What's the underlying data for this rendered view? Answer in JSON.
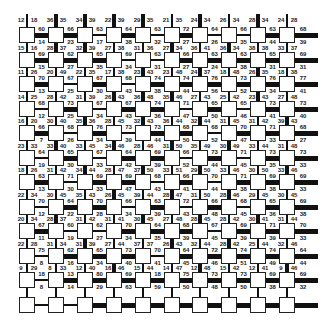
{
  "grid": {
    "cols": 10,
    "rows": 12,
    "col_x": [
      27,
      56,
      85,
      114,
      143,
      172,
      200,
      229,
      258,
      287
    ],
    "row_y": [
      35,
      60,
      84,
      109,
      133,
      158,
      182,
      207,
      231,
      256,
      280,
      305
    ],
    "right_stub": 318,
    "top_stub": 14,
    "colors": {
      "line": "#111111",
      "node_fill": "#ffffff",
      "node_border": "#222222",
      "text": "#222222"
    }
  },
  "top_edge_labels": [
    [
      "12",
      "18"
    ],
    [
      "36",
      "35"
    ],
    [
      "34",
      "39"
    ],
    [
      "22",
      "39"
    ],
    [
      "29",
      "35"
    ],
    [
      "21",
      "35"
    ],
    [
      "24",
      "34"
    ],
    [
      "26",
      "34"
    ],
    [
      "28",
      "34"
    ],
    [
      "24",
      "28"
    ]
  ],
  "row_labels": [
    {
      "horizontal": [
        "60",
        "66",
        "63",
        "64",
        "63",
        "72",
        "64",
        "66",
        "63",
        "68"
      ],
      "left_right": [
        [
          "15",
          "16"
        ],
        [
          "28",
          "37"
        ],
        [
          "32",
          "39"
        ],
        [
          "27",
          "38"
        ],
        [
          "31",
          "36"
        ],
        [
          "27",
          "34"
        ],
        [
          "36",
          "41"
        ],
        [
          "36",
          "34"
        ],
        [
          "38",
          "38"
        ],
        [
          "33",
          "37"
        ]
      ],
      "below": [
        "14",
        "23",
        "17",
        "38",
        "32",
        "27",
        "26",
        "35",
        "44",
        "39"
      ]
    },
    {
      "horizontal": [
        "69",
        "62",
        "65",
        "69",
        "63",
        "66",
        "63",
        "63",
        "65",
        "69"
      ],
      "left_right": [
        [
          "11",
          "26"
        ],
        [
          "20",
          "49"
        ],
        [
          "22",
          "35"
        ],
        [
          "17",
          "38"
        ],
        [
          "23",
          "43"
        ],
        [
          "23",
          "48"
        ],
        [
          "24",
          "37"
        ],
        [
          "18",
          "48"
        ],
        [
          "26",
          "35"
        ],
        [
          "18",
          "38"
        ]
      ],
      "below": [
        "15",
        "27",
        "35",
        "34",
        "31",
        "27",
        "24",
        "38",
        "31",
        "31"
      ]
    },
    {
      "horizontal": [
        "70",
        "67",
        "67",
        "68",
        "74",
        "74",
        "76",
        "73",
        "76",
        "77"
      ],
      "left_right": [
        [
          "14",
          "25"
        ],
        [
          "28",
          "42"
        ],
        [
          "31",
          "39"
        ],
        [
          "26",
          "43"
        ],
        [
          "36",
          "48"
        ],
        [
          "35",
          "46"
        ],
        [
          "27",
          "43"
        ],
        [
          "25",
          "42"
        ],
        [
          "23",
          "43"
        ],
        [
          "27",
          "48"
        ]
      ],
      "below": [
        "13",
        "25",
        "30",
        "43",
        "38",
        "44",
        "56",
        "52",
        "34",
        "41"
      ]
    },
    {
      "horizontal": [
        "68",
        "73",
        "67",
        "67",
        "74",
        "71",
        "65",
        "65",
        "73",
        "73"
      ],
      "left_right": [
        [
          "16",
          "20"
        ],
        [
          "30",
          "40"
        ],
        [
          "35",
          "36"
        ],
        [
          "28",
          "45"
        ],
        [
          "32",
          "43"
        ],
        [
          "36",
          "44"
        ],
        [
          "32",
          "44"
        ],
        [
          "31",
          "45"
        ],
        [
          "31",
          "42"
        ],
        [
          "39",
          "43"
        ]
      ],
      "below": [
        "12",
        "25",
        "34",
        "43",
        "36",
        "47",
        "50",
        "46",
        "41",
        "40"
      ]
    },
    {
      "horizontal": [
        "66",
        "68",
        "76",
        "73",
        "73",
        "68",
        "68",
        "70",
        "71",
        "68"
      ],
      "left_right": [
        [
          "23",
          "33"
        ],
        [
          "33",
          "40"
        ],
        [
          "33",
          "45"
        ],
        [
          "34",
          "46"
        ],
        [
          "28",
          "46"
        ],
        [
          "31",
          "50"
        ],
        [
          "35",
          "49"
        ],
        [
          "30",
          "49"
        ],
        [
          "33",
          "44"
        ],
        [
          "31",
          "48"
        ]
      ],
      "below": [
        "7",
        "26",
        "34",
        "39",
        "44",
        "50",
        "52",
        "47",
        "33",
        "27"
      ]
    },
    {
      "horizontal": [
        "64",
        "65",
        "67",
        "64",
        "69",
        "66",
        "73",
        "71",
        "73",
        "73"
      ],
      "left_right": [
        [
          "18",
          "26"
        ],
        [
          "31",
          "42"
        ],
        [
          "34",
          "44"
        ],
        [
          "28",
          "47"
        ],
        [
          "37",
          "50"
        ],
        [
          "33",
          "51"
        ],
        [
          "29",
          "50"
        ],
        [
          "33",
          "46"
        ],
        [
          "30",
          "50"
        ],
        [
          "33",
          "46"
        ]
      ],
      "below": [
        "19",
        "30",
        "33",
        "42",
        "39",
        "52",
        "44",
        "45",
        "35",
        "33"
      ]
    },
    {
      "horizontal": [
        "63",
        "71",
        "69",
        "69",
        "68",
        "66",
        "70",
        "71",
        "69",
        "69"
      ],
      "left_right": [
        [
          "22",
          "34"
        ],
        [
          "30",
          "45"
        ],
        [
          "35",
          "43"
        ],
        [
          "26",
          "45"
        ],
        [
          "39",
          "44"
        ],
        [
          "28",
          "47"
        ],
        [
          "31",
          "50"
        ],
        [
          "28",
          "46"
        ],
        [
          "29",
          "45"
        ],
        [
          "30",
          "45"
        ]
      ],
      "below": [
        "13",
        "30",
        "33",
        "47",
        "43",
        "41",
        "44",
        "38",
        "38",
        "33"
      ]
    },
    {
      "horizontal": [
        "70",
        "64",
        "70",
        "66",
        "63",
        "72",
        "66",
        "68",
        "65",
        "69"
      ],
      "left_right": [
        [
          "20",
          "34"
        ],
        [
          "28",
          "37"
        ],
        [
          "31",
          "42"
        ],
        [
          "31",
          "41"
        ],
        [
          "30",
          "45"
        ],
        [
          "27",
          "48"
        ],
        [
          "28",
          "45"
        ],
        [
          "28",
          "42"
        ],
        [
          "30",
          "41"
        ],
        [
          "31",
          "44"
        ]
      ],
      "below": [
        "12",
        "22",
        "28",
        "34",
        "39",
        "43",
        "48",
        "45",
        "36",
        "38"
      ]
    },
    {
      "horizontal": [
        "67",
        "60",
        "62",
        "70",
        "64",
        "68",
        "67",
        "69",
        "71",
        "70"
      ],
      "left_right": [
        [
          "22",
          "28"
        ],
        [
          "31",
          "34"
        ],
        [
          "31",
          "39"
        ],
        [
          "27",
          "44"
        ],
        [
          "37",
          "37"
        ],
        [
          "26",
          "43"
        ],
        [
          "32",
          "44"
        ],
        [
          "28",
          "42"
        ],
        [
          "25",
          "44"
        ],
        [
          "32",
          "46"
        ]
      ],
      "below": [
        "11",
        "19",
        "27",
        "34",
        "35",
        "39",
        "45",
        "39",
        "39",
        "33"
      ]
    },
    {
      "horizontal": [
        "75",
        "62",
        "65",
        "73",
        "70",
        "64",
        "72",
        "74",
        "74",
        "64"
      ],
      "left_right": [
        [
          "9",
          "29"
        ],
        [
          "8",
          "33"
        ],
        [
          "12",
          "40"
        ],
        [
          "16",
          "46"
        ],
        [
          "15",
          "44"
        ],
        [
          "14",
          "47"
        ],
        [
          "12",
          "48"
        ],
        [
          "15",
          "42"
        ],
        [
          "12",
          "41"
        ],
        [
          "9",
          "46"
        ]
      ],
      "below": [
        "8",
        "16",
        "34",
        "40",
        "41",
        "45",
        "46",
        "51",
        "49",
        "44"
      ]
    },
    {
      "horizontal": [
        "18",
        "13",
        "80",
        "69",
        "18",
        "75",
        "73",
        "73",
        "69",
        "69"
      ],
      "left_right": [],
      "below": [
        "8",
        "14",
        "29",
        "63",
        "59",
        "50",
        "48",
        "50",
        "38",
        "32"
      ]
    }
  ],
  "thick_h_edges": [
    [
      0,
      1
    ],
    [
      0,
      2
    ],
    [
      0,
      4
    ],
    [
      0,
      6
    ],
    [
      0,
      9
    ],
    [
      1,
      1
    ],
    [
      1,
      2
    ],
    [
      1,
      3
    ],
    [
      1,
      6
    ],
    [
      1,
      7
    ],
    [
      1,
      8
    ],
    [
      1,
      9
    ],
    [
      2,
      1
    ],
    [
      2,
      3
    ],
    [
      2,
      5
    ],
    [
      2,
      6
    ],
    [
      2,
      7
    ],
    [
      2,
      8
    ],
    [
      2,
      9
    ],
    [
      3,
      2
    ],
    [
      3,
      4
    ],
    [
      3,
      5
    ],
    [
      3,
      7
    ],
    [
      3,
      9
    ],
    [
      4,
      1
    ],
    [
      4,
      3
    ],
    [
      4,
      5
    ],
    [
      4,
      6
    ],
    [
      4,
      8
    ],
    [
      4,
      9
    ],
    [
      5,
      2
    ],
    [
      5,
      4
    ],
    [
      5,
      5
    ],
    [
      5,
      7
    ],
    [
      5,
      9
    ],
    [
      6,
      1
    ],
    [
      6,
      3
    ],
    [
      6,
      4
    ],
    [
      6,
      6
    ],
    [
      6,
      8
    ],
    [
      6,
      9
    ],
    [
      7,
      2
    ],
    [
      7,
      3
    ],
    [
      7,
      5
    ],
    [
      7,
      7
    ],
    [
      7,
      9
    ],
    [
      8,
      1
    ],
    [
      8,
      4
    ],
    [
      8,
      5
    ],
    [
      8,
      6
    ],
    [
      8,
      8
    ],
    [
      8,
      9
    ],
    [
      9,
      2
    ],
    [
      9,
      3
    ],
    [
      9,
      4
    ],
    [
      9,
      6
    ],
    [
      9,
      7
    ],
    [
      9,
      8
    ],
    [
      9,
      9
    ],
    [
      10,
      2
    ],
    [
      10,
      3
    ],
    [
      10,
      4
    ],
    [
      10,
      5
    ],
    [
      10,
      6
    ],
    [
      10,
      7
    ],
    [
      10,
      8
    ],
    [
      10,
      9
    ],
    [
      11,
      3
    ],
    [
      11,
      4
    ],
    [
      11,
      5
    ],
    [
      11,
      6
    ],
    [
      11,
      7
    ],
    [
      11,
      8
    ],
    [
      11,
      9
    ]
  ],
  "thick_v_edges": [
    [
      0,
      1
    ],
    [
      0,
      2
    ],
    [
      0,
      3
    ],
    [
      0,
      4
    ],
    [
      0,
      6
    ],
    [
      0,
      8
    ],
    [
      1,
      1
    ],
    [
      1,
      2
    ],
    [
      1,
      5
    ],
    [
      1,
      7
    ],
    [
      2,
      4
    ],
    [
      2,
      6
    ],
    [
      2,
      8
    ],
    [
      3,
      3
    ],
    [
      3,
      4
    ],
    [
      3,
      5
    ],
    [
      3,
      8
    ],
    [
      4,
      2
    ],
    [
      4,
      4
    ],
    [
      4,
      6
    ],
    [
      4,
      9
    ],
    [
      5,
      1
    ],
    [
      5,
      3
    ],
    [
      5,
      5
    ],
    [
      5,
      7
    ],
    [
      6,
      2
    ],
    [
      6,
      4
    ],
    [
      6,
      6
    ],
    [
      6,
      9
    ],
    [
      7,
      3
    ],
    [
      7,
      5
    ],
    [
      7,
      7
    ],
    [
      8,
      1
    ],
    [
      8,
      4
    ],
    [
      8,
      6
    ],
    [
      8,
      8
    ],
    [
      9,
      2
    ],
    [
      9,
      5
    ],
    [
      9,
      7
    ],
    [
      10,
      3
    ],
    [
      10,
      6
    ],
    [
      10,
      9
    ]
  ]
}
